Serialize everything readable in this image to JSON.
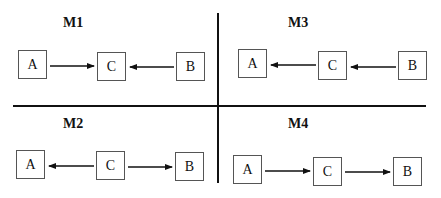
{
  "panels": [
    {
      "id": "M1",
      "title": "M1",
      "nodes": [
        "A",
        "C",
        "B"
      ],
      "edges": [
        {
          "from": "A",
          "to": "C"
        },
        {
          "from": "B",
          "to": "C"
        }
      ]
    },
    {
      "id": "M3",
      "title": "M3",
      "nodes": [
        "A",
        "C",
        "B"
      ],
      "edges": [
        {
          "from": "C",
          "to": "A"
        },
        {
          "from": "B",
          "to": "C"
        }
      ]
    },
    {
      "id": "M2",
      "title": "M2",
      "nodes": [
        "A",
        "C",
        "B"
      ],
      "edges": [
        {
          "from": "C",
          "to": "A"
        },
        {
          "from": "C",
          "to": "B"
        }
      ]
    },
    {
      "id": "M4",
      "title": "M4",
      "nodes": [
        "A",
        "C",
        "B"
      ],
      "edges": [
        {
          "from": "A",
          "to": "C"
        },
        {
          "from": "C",
          "to": "B"
        }
      ]
    }
  ],
  "colors": {
    "line": "#111111",
    "box_border": "#555555",
    "background": "#ffffff"
  }
}
